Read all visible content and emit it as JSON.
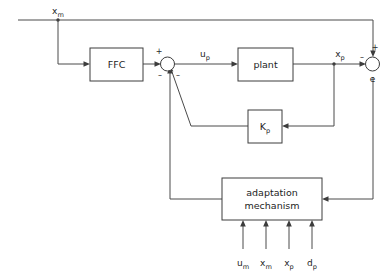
{
  "diagram": {
    "blocks": [
      {
        "id": "ffc",
        "label": "FFC",
        "label_base": "FFC",
        "label_sub": ""
      },
      {
        "id": "plant",
        "label": "plant",
        "label_base": "plant",
        "label_sub": ""
      },
      {
        "id": "kp",
        "label": "Kp",
        "label_base": "K",
        "label_sub": "p"
      },
      {
        "id": "adaptation",
        "label": "adaptation mechanism",
        "line1": "adaptation",
        "line2": "mechanism"
      }
    ],
    "signals": [
      {
        "id": "xm-top",
        "base": "x",
        "sub": "m"
      },
      {
        "id": "up",
        "base": "u",
        "sub": "p"
      },
      {
        "id": "xp",
        "base": "x",
        "sub": "p"
      },
      {
        "id": "e",
        "base": "e",
        "sub": ""
      }
    ],
    "junction_signs": {
      "sum_left_plus": "+",
      "sum_left_minus_a": "–",
      "sum_left_minus_b": "–",
      "sum_right_plus": "+",
      "sum_right_minus": "–"
    },
    "adaptation_inputs": [
      {
        "base": "u",
        "sub": "m"
      },
      {
        "base": "x",
        "sub": "m"
      },
      {
        "base": "x",
        "sub": "p"
      },
      {
        "base": "d",
        "sub": "p"
      }
    ],
    "colors": {
      "line": "#4a4a4a",
      "block_border": "#3c3c3c",
      "text": "#1d1d1d",
      "background": "#ffffff"
    }
  }
}
